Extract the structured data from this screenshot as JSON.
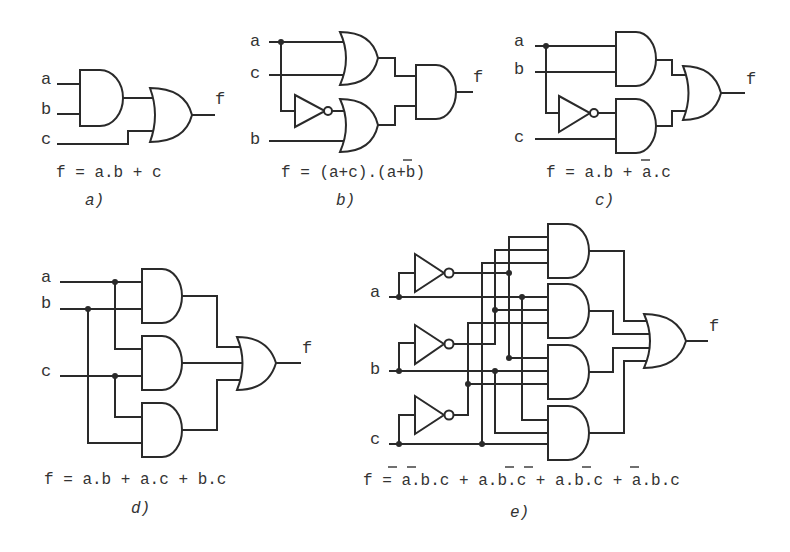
{
  "figure": {
    "panels": [
      {
        "id": "a",
        "caption": "a)",
        "inputs": [
          "a",
          "b",
          "c"
        ],
        "output": "f",
        "equation": "f = a.b + c",
        "gates": [
          "AND",
          "OR"
        ]
      },
      {
        "id": "b",
        "caption": "b)",
        "inputs": [
          "a",
          "c",
          "b"
        ],
        "output": "f",
        "equation": "f = (a+c).(a+b)",
        "equation_overbars": [
          "a (second term)"
        ],
        "gates": [
          "OR",
          "NOT",
          "OR",
          "AND"
        ]
      },
      {
        "id": "c",
        "caption": "c)",
        "inputs": [
          "a",
          "b",
          "c"
        ],
        "output": "f",
        "equation": "f = a.b + a.c",
        "equation_overbars": [
          "a (second term)"
        ],
        "gates": [
          "AND",
          "NOT",
          "AND",
          "OR"
        ]
      },
      {
        "id": "d",
        "caption": "d)",
        "inputs": [
          "a",
          "b",
          "c"
        ],
        "output": "f",
        "equation": "f = a.b + a.c + b.c",
        "gates": [
          "AND",
          "AND",
          "AND",
          "OR"
        ]
      },
      {
        "id": "e",
        "caption": "e)",
        "inputs": [
          "a",
          "b",
          "c"
        ],
        "output": "f",
        "equation": "f = a.b.c + a.b.c + a.b.c + a.b.c",
        "equation_terms": [
          "a̅.b̅.c",
          "a.b̅.c̅",
          "a̅.b.c̅",
          "a.b.c"
        ],
        "gates": [
          "NOT",
          "NOT",
          "NOT",
          "AND",
          "AND",
          "AND",
          "AND",
          "OR"
        ]
      }
    ],
    "labels": {
      "a": "a",
      "b": "b",
      "c": "c",
      "f": "f",
      "eq_a": "f = a.b + c",
      "eq_b": "f = (a+c).(a+b)",
      "eq_c": "f = a.b + a.c",
      "eq_d": "f = a.b + a.c + b.c",
      "eq_e": "f = a.b.c + a.b.c + a.b.c + a.b.c",
      "cap_a": "a)",
      "cap_b": "b)",
      "cap_c": "c)",
      "cap_d": "d)",
      "cap_e": "e)"
    }
  }
}
